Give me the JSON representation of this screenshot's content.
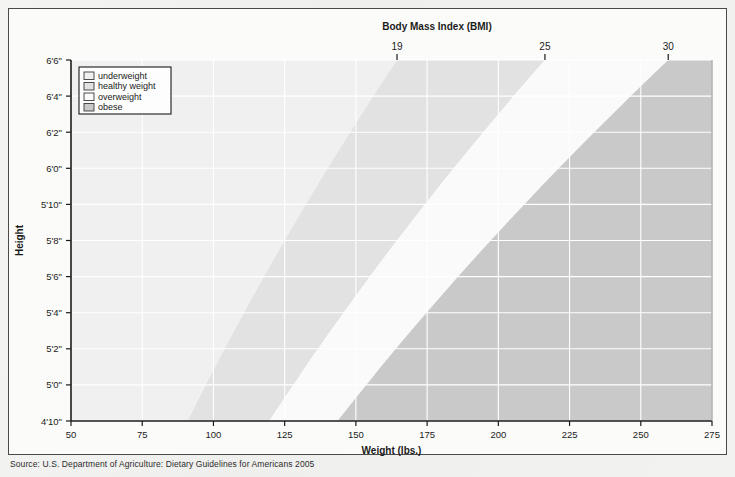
{
  "figure": {
    "top_axis_title": "Body Mass Index (BMI)",
    "x_axis_title": "Weight (lbs.)",
    "y_axis_title": "Height",
    "source_note": "Source: U.S. Department of Agriculture: Dietary Guidelines for Americans 2005"
  },
  "legend": {
    "items": [
      {
        "label": "underweight",
        "color": "#f0f0f0"
      },
      {
        "label": "healthy weight",
        "color": "#e2e2e2"
      },
      {
        "label": "overweight",
        "color": "#fafafa"
      },
      {
        "label": "obese",
        "color": "#c9c9c9"
      }
    ]
  },
  "chart_data": {
    "type": "area",
    "title": "Body Mass Index (BMI)",
    "xlabel": "Weight (lbs.)",
    "ylabel": "Height",
    "top_axis_label": "Body Mass Index (BMI)",
    "grid": true,
    "legend_position": "top-left",
    "xlim": [
      50,
      275
    ],
    "ylim": [
      58,
      78
    ],
    "x_ticks": [
      50,
      75,
      100,
      125,
      150,
      175,
      200,
      225,
      250,
      275
    ],
    "x_tick_labels": [
      "50",
      "75",
      "100",
      "125",
      "150",
      "175",
      "200",
      "225",
      "250",
      "275"
    ],
    "y_ticks": [
      58,
      60,
      62,
      64,
      66,
      68,
      70,
      72,
      74,
      76,
      78
    ],
    "y_tick_labels": [
      "4'10\"",
      "5'0\"",
      "5'2\"",
      "5'4\"",
      "5'6\"",
      "5'8\"",
      "5'10\"",
      "6'0\"",
      "6'2\"",
      "6'4\"",
      "6'6\""
    ],
    "top_ticks": [
      19,
      25,
      30
    ],
    "top_tick_labels": [
      "19",
      "25",
      "30"
    ],
    "bmi_constant": 703,
    "bmi_boundaries": [
      {
        "bmi": 19,
        "label": "underweight / healthy weight"
      },
      {
        "bmi": 25,
        "label": "healthy weight / overweight"
      },
      {
        "bmi": 30,
        "label": "overweight / obese"
      }
    ],
    "bands": [
      {
        "name": "underweight",
        "bmi_min": 0,
        "bmi_max": 19,
        "color": "#f0f0f0"
      },
      {
        "name": "healthy weight",
        "bmi_min": 19,
        "bmi_max": 25,
        "color": "#e2e2e2"
      },
      {
        "name": "overweight",
        "bmi_min": 25,
        "bmi_max": 30,
        "color": "#fafafa"
      },
      {
        "name": "obese",
        "bmi_min": 30,
        "bmi_max": 99,
        "color": "#c9c9c9"
      }
    ],
    "boundary_weights_at_heights": [
      {
        "height_label": "4'10\"",
        "height_in": 58,
        "w_bmi19": 90.9,
        "w_bmi25": 119.6,
        "w_bmi30": 143.5
      },
      {
        "height_label": "5'0\"",
        "height_in": 60,
        "w_bmi19": 97.3,
        "w_bmi25": 128.0,
        "w_bmi30": 153.6
      },
      {
        "height_label": "5'2\"",
        "height_in": 62,
        "w_bmi19": 103.9,
        "w_bmi25": 136.7,
        "w_bmi30": 164.0
      },
      {
        "height_label": "5'4\"",
        "height_in": 64,
        "w_bmi19": 110.7,
        "w_bmi25": 145.7,
        "w_bmi30": 174.8
      },
      {
        "height_label": "5'6\"",
        "height_in": 66,
        "w_bmi19": 117.8,
        "w_bmi25": 154.9,
        "w_bmi30": 185.9
      },
      {
        "height_label": "5'8\"",
        "height_in": 68,
        "w_bmi19": 125.1,
        "w_bmi25": 164.6,
        "w_bmi30": 197.5
      },
      {
        "height_label": "5'10\"",
        "height_in": 70,
        "w_bmi19": 132.6,
        "w_bmi25": 174.4,
        "w_bmi30": 209.3
      },
      {
        "height_label": "6'0\"",
        "height_in": 72,
        "w_bmi19": 140.2,
        "w_bmi25": 184.5,
        "w_bmi30": 221.4
      },
      {
        "height_label": "6'2\"",
        "height_in": 74,
        "w_bmi19": 148.1,
        "w_bmi25": 194.9,
        "w_bmi30": 233.9
      },
      {
        "height_label": "6'4\"",
        "height_in": 76,
        "w_bmi19": 156.2,
        "w_bmi25": 205.5,
        "w_bmi30": 246.6
      },
      {
        "height_label": "6'6\"",
        "height_in": 78,
        "w_bmi19": 164.5,
        "w_bmi25": 216.4,
        "w_bmi30": 259.7
      }
    ]
  }
}
